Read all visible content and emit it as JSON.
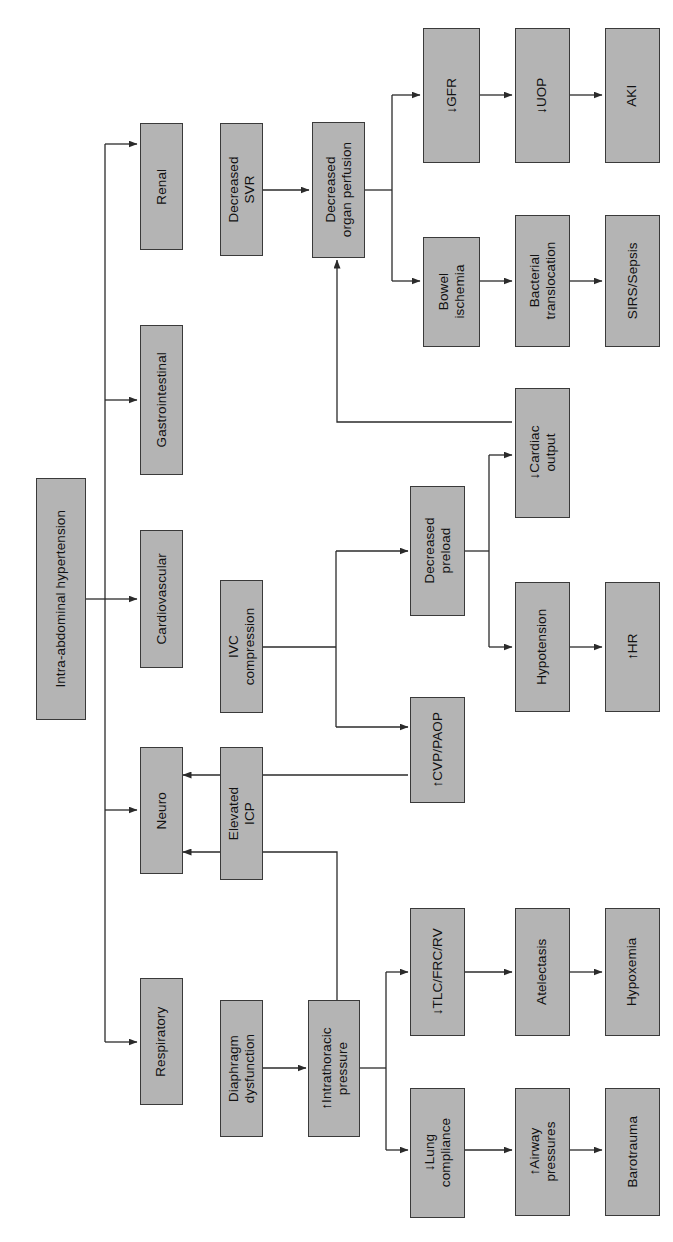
{
  "diagram": {
    "orientation": "rotated-90-ccw",
    "box_fill": "#b4b4b4",
    "box_border": "#3a3a3a",
    "line_color": "#2b2b2b",
    "background": "#ffffff"
  },
  "nodes": {
    "root": "Intra-abdominal hypertension",
    "systems": {
      "renal": "Renal",
      "gastrointestinal": "Gastrointestinal",
      "cardiovascular": "Cardiovascular",
      "neuro": "Neuro",
      "respiratory": "Respiratory"
    },
    "renal_chain": {
      "decreased_svr": "Decreased\nSVR",
      "decreased_organ_perfusion": "Decreased\norgan perfusion",
      "gfr": "↓GFR",
      "uop": "↓UOP",
      "aki": "AKI"
    },
    "gi_chain": {
      "bowel_ischemia": "Bowel\nischemia",
      "bacterial_translocation": "Bacterial\ntranslocation",
      "sirs_sepsis": "SIRS/Sepsis"
    },
    "cv_chain": {
      "ivc_compression": "IVC\ncompression",
      "decreased_preload": "Decreased\npreload",
      "cvp_paop": "↑CVP/PAOP",
      "cardiac_output": "↓Cardiac\noutput",
      "hypotension": "Hypotension",
      "hr": "↑HR"
    },
    "neuro_chain": {
      "elevated_icp": "Elevated\nICP"
    },
    "resp_chain": {
      "diaphragm_dysfunction": "Diaphragm\ndysfunction",
      "intrathoracic_pressure": "↑Intrathoracic\npressure",
      "tlc_frc_rv": "↓TLC/FRC/RV",
      "atelectasis": "Atelectasis",
      "hypoxemia": "Hypoxemia",
      "lung_compliance": "↓Lung\ncompliance",
      "airway_pressures": "↑Airway\npressures",
      "barotrauma": "Barotrauma"
    }
  },
  "edges": [
    {
      "from": "root",
      "to": "renal"
    },
    {
      "from": "root",
      "to": "gastrointestinal"
    },
    {
      "from": "root",
      "to": "cardiovascular"
    },
    {
      "from": "root",
      "to": "neuro"
    },
    {
      "from": "root",
      "to": "respiratory"
    },
    {
      "from": "decreased_svr",
      "to": "decreased_organ_perfusion"
    },
    {
      "from": "decreased_organ_perfusion",
      "to": "gfr"
    },
    {
      "from": "gfr",
      "to": "uop"
    },
    {
      "from": "uop",
      "to": "aki"
    },
    {
      "from": "decreased_organ_perfusion",
      "to": "bowel_ischemia"
    },
    {
      "from": "bowel_ischemia",
      "to": "bacterial_translocation"
    },
    {
      "from": "bacterial_translocation",
      "to": "sirs_sepsis"
    },
    {
      "from": "cardiac_output",
      "to": "decreased_organ_perfusion"
    },
    {
      "from": "ivc_compression",
      "to": "decreased_preload"
    },
    {
      "from": "ivc_compression",
      "to": "cvp_paop"
    },
    {
      "from": "decreased_preload",
      "to": "cardiac_output"
    },
    {
      "from": "decreased_preload",
      "to": "hypotension"
    },
    {
      "from": "hypotension",
      "to": "hr"
    },
    {
      "from": "cvp_paop",
      "to": "elevated_icp"
    },
    {
      "from": "intrathoracic_pressure",
      "to": "elevated_icp"
    },
    {
      "from": "diaphragm_dysfunction",
      "to": "intrathoracic_pressure"
    },
    {
      "from": "intrathoracic_pressure",
      "to": "tlc_frc_rv"
    },
    {
      "from": "tlc_frc_rv",
      "to": "atelectasis"
    },
    {
      "from": "atelectasis",
      "to": "hypoxemia"
    },
    {
      "from": "intrathoracic_pressure",
      "to": "lung_compliance"
    },
    {
      "from": "lung_compliance",
      "to": "airway_pressures"
    },
    {
      "from": "airway_pressures",
      "to": "barotrauma"
    }
  ]
}
